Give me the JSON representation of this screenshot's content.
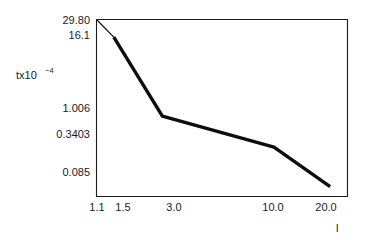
{
  "chart_data": {
    "type": "line",
    "title": "",
    "xlabel": "l",
    "ylabel": "tx10",
    "ylabel_exponent": "−4",
    "xscale": "log",
    "yscale": "log",
    "grid": false,
    "legend": null,
    "xticks": [
      "1.1",
      "1.5",
      "3.0",
      "10.0",
      "20.0"
    ],
    "xtick_values": [
      1.1,
      1.5,
      3.0,
      10.0,
      20.0
    ],
    "yticks": [
      "29.80",
      "16.1",
      "1.006",
      "0.3403",
      "0.085"
    ],
    "ytick_values": [
      29.8,
      16.1,
      1.006,
      0.3403,
      0.085
    ],
    "xlim": [
      1.1,
      21.5
    ],
    "ylim": [
      0.06,
      29.8
    ],
    "x": [
      1.1,
      1.35,
      2.4,
      9.0,
      17.5
    ],
    "values": [
      29.8,
      16.1,
      1.006,
      0.3403,
      0.085
    ],
    "series": [
      {
        "name": "t",
        "x": [
          1.1,
          1.35,
          2.4,
          9.0,
          17.5
        ],
        "values": [
          29.8,
          16.1,
          1.006,
          0.3403,
          0.085
        ]
      }
    ]
  },
  "axes": {
    "y_title_base": "tx10",
    "y_title_exp": "−4",
    "x_title": "l"
  },
  "ytick_labels": {
    "t0": "29.80",
    "t1": "16.1",
    "t2": "1.006",
    "t3": "0.3403",
    "t4": "0.085"
  },
  "xtick_labels": {
    "t0": "1.1",
    "t1": "1.5",
    "t2": "3.0",
    "t3": "10.0",
    "t4": "20.0"
  }
}
